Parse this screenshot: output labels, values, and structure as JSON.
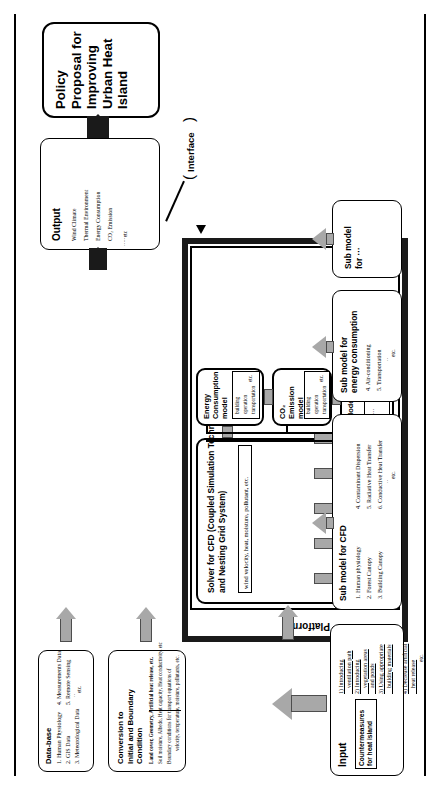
{
  "figure": {
    "title_block": {
      "policy_label": "Policy\nProposal for\nImproving\nUrban Heat\nIsland"
    },
    "output": {
      "heading": "Output",
      "items": [
        "Wind Climate",
        "Thermal Environment",
        "Energy Consumption",
        "CO₂ Emission"
      ],
      "etc": "etc"
    },
    "interface_label": "Interface",
    "platform_label": "Platform",
    "database": {
      "heading": "Data-base",
      "items": [
        "1. Human Physiology",
        "2. GIS Data",
        "3. Meteorological Data",
        "4. Measurements Data",
        "5. Remote Sensing"
      ],
      "etc": "etc."
    },
    "conversion_box": {
      "label": "Conversion to\nInitial and Boundary\nCondition",
      "note_bold": "Land cover, Geometry, Artificial heat release, etc.",
      "note_lines": [
        "Soil moisture, Albedo, Heat capacity, Heat conductivity, etc",
        "Boundary conditions for transport equations of",
        "velocity, temperature, moisture, pollutants, etc."
      ]
    },
    "solver": {
      "title": "Solver for CFD (Coupled Simulation Technique\nand Nesting Grid System)",
      "transport_note": "wind velocity, heat, moisture, pollutant, etc.",
      "scales": [
        "1.Human\nscale",
        "2.Room\nscale",
        "3.Building\nscale",
        "4.City\nblock\nscale",
        "5.Urban\nscale"
      ]
    },
    "models": [
      {
        "name": "Energy\nConsumption\nmodel",
        "items": [
          "building",
          "operation",
          "transportation"
        ],
        "etc": "etc."
      },
      {
        "name": "CO₂\nEmission\nmodel",
        "items": [
          "building",
          "operation",
          "transportation"
        ],
        "etc": "etc."
      },
      {
        "name": "Model",
        "items": [
          "···"
        ],
        "etc": "etc."
      }
    ],
    "submodels": [
      {
        "heading": "Sub model for CFD",
        "items": [
          "1. Human physiology",
          "2. Forest Canopy",
          "3. Building Canopy",
          "4. Contaminant Dispersion",
          "5. Radiative Heat Transfer",
          "6. Conductive Heat Transfer"
        ],
        "etc": "etc."
      },
      {
        "heading": "Sub model for\nenergy consumption",
        "items": [
          "4. Air-conditioning",
          "5. Transportation"
        ],
        "etc": "etc."
      },
      {
        "heading": "Sub model\nfor ···",
        "items": [],
        "etc": ""
      }
    ],
    "input": {
      "heading": "Input",
      "subtitle": "Countermeasures\nfor heat island",
      "items": [
        "1) Introducing\n    ventilation path",
        "2) Introducing\n    vegetation areas\n    and ponds",
        "3) Using appropriate\n    building materials",
        "4) Decrease artificial\n    heat release"
      ],
      "etc": "etc."
    },
    "colors": {
      "arrow_fill": "#a8a8a8",
      "arrow_stroke": "#4d4d4d",
      "bar": "#1a1a1a",
      "ink": "#000000",
      "paper": "#ffffff"
    }
  }
}
